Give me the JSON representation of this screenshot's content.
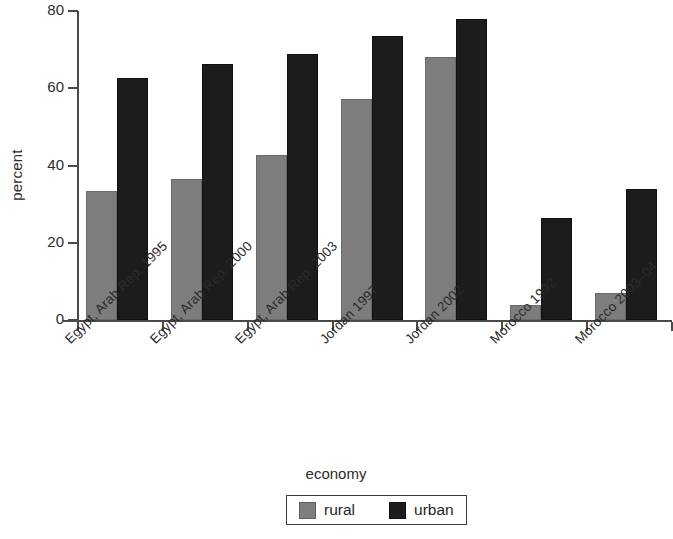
{
  "chart_data": {
    "type": "bar",
    "title": "",
    "xlabel": "economy",
    "ylabel": "percent",
    "ylim": [
      0,
      80
    ],
    "yticks": [
      0,
      20,
      40,
      60,
      80
    ],
    "ytick_labels": [
      "0",
      "20",
      "40",
      "60",
      "80"
    ],
    "grid": false,
    "legend_position": "bottom-center",
    "categories": [
      "Egypt, Arab Rep. 1995",
      "Egypt, Arab Rep. 2000",
      "Egypt, Arab Rep. 2003",
      "Jordan 1997",
      "Jordan 2002",
      "Morocco 1992",
      "Morocco 2003–04"
    ],
    "series": [
      {
        "name": "rural",
        "color": "#7d7d7d",
        "values": [
          33.3,
          36.6,
          42.7,
          57.3,
          68.2,
          3.9,
          7.1
        ]
      },
      {
        "name": "urban",
        "color": "#1c1c1c",
        "values": [
          62.7,
          66.2,
          68.8,
          73.5,
          77.8,
          26.5,
          33.8
        ]
      }
    ]
  },
  "axes": {
    "y_title": "percent",
    "x_title": "economy"
  },
  "legend": {
    "entries": [
      {
        "label": "rural",
        "swatch": "rural-swatch"
      },
      {
        "label": "urban",
        "swatch": "urban-swatch"
      }
    ]
  }
}
